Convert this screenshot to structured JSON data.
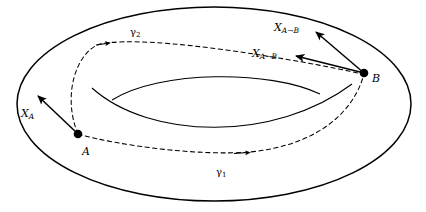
{
  "figure": {
    "surface_name": "torus",
    "stroke_color": "#000000",
    "background_color": "#ffffff"
  },
  "points": [
    {
      "id": "A",
      "label": "A",
      "x": 78,
      "y": 134
    },
    {
      "id": "B",
      "label": "B",
      "x": 364,
      "y": 73
    }
  ],
  "vectors": [
    {
      "id": "X_A",
      "base": "X",
      "subscript": "A",
      "label": "X",
      "sub_text": "A",
      "anchor_point": "A",
      "from_x": 78,
      "from_y": 134,
      "to_x": 38,
      "to_y": 96
    },
    {
      "id": "X_AB_upper",
      "base": "X",
      "label": "X",
      "sub_from": "A",
      "sub_arrow": "→",
      "sub_to": "B",
      "anchor_point": "B",
      "from_x": 364,
      "from_y": 73,
      "to_x": 316,
      "to_y": 32
    },
    {
      "id": "X_AB_lower",
      "base": "X",
      "label": "X",
      "sub_from": "A",
      "sub_arrow": "→",
      "sub_to": "B",
      "anchor_point": "B",
      "from_x": 364,
      "from_y": 73,
      "to_x": 296,
      "to_y": 56
    }
  ],
  "paths": [
    {
      "id": "gamma1",
      "label": "γ",
      "subscript": "1",
      "style": "dashed",
      "from": "A",
      "to": "B",
      "route": "lower"
    },
    {
      "id": "gamma2",
      "label": "γ",
      "subscript": "2",
      "style": "dashed",
      "from": "A",
      "to": "B",
      "route": "upper"
    }
  ],
  "geometry": {
    "outer_ellipse": {
      "cx": 214,
      "cy": 104,
      "rx": 197,
      "ry": 97
    },
    "inner_hole_upper": "M 112,100 C 160,70 270,70 320,94",
    "inner_hole_lower": "M 92,88 C 150,140 275,142 352,84",
    "gamma2_path": "M 78,134 C 62,96 76,52 100,44 C 150,34 300,60 362,74",
    "gamma1_path": "M 78,134 C 120,146 200,156 250,152 C 310,146 352,118 364,74",
    "gamma2_arrow_at": {
      "x": 102,
      "y": 44
    },
    "gamma1_arrow_at": {
      "x": 243,
      "y": 153
    }
  }
}
